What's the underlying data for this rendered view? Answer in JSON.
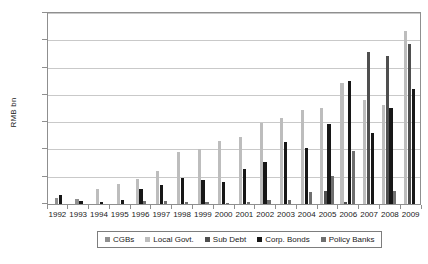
{
  "chart_data": {
    "type": "bar",
    "title": "",
    "xlabel": "",
    "ylabel": "RMB bn",
    "ylim": [
      0,
      1400
    ],
    "ytick_values": [
      0,
      200,
      400,
      600,
      800,
      1000,
      1200,
      1400
    ],
    "ytick_labels": [
      "0",
      "200",
      "400",
      "600",
      "800",
      "1,000",
      "1,200",
      "1,400"
    ],
    "grid": true,
    "legend_position": "bottom",
    "categories": [
      "1992",
      "1993",
      "1994",
      "1995",
      "1996",
      "1997",
      "1998",
      "1999",
      "2000",
      "2001",
      "2002",
      "2003",
      "2004",
      "2005",
      "2006",
      "2007",
      "2008",
      "2009"
    ],
    "series": [
      {
        "name": "CGBs",
        "color": "#8f8f8f",
        "values": [
          45,
          35,
          0,
          0,
          0,
          0,
          0,
          0,
          0,
          0,
          0,
          0,
          0,
          0,
          0,
          0,
          0,
          0
        ]
      },
      {
        "name": "Local Govt.",
        "color": "#bdbdbd",
        "values": [
          0,
          0,
          113,
          150,
          182,
          242,
          382,
          400,
          462,
          490,
          594,
          627,
          692,
          703,
          884,
          766,
          723,
          1270
        ]
      },
      {
        "name": "Sub Debt",
        "color": "#4f4f4f",
        "values": [
          0,
          0,
          0,
          0,
          0,
          0,
          0,
          0,
          0,
          0,
          0,
          0,
          0,
          97,
          16,
          1111,
          1083,
          1170
        ]
      },
      {
        "name": "Corp. Bonds",
        "color": "#171717",
        "values": [
          64,
          19,
          13,
          28,
          108,
          143,
          194,
          178,
          163,
          258,
          306,
          456,
          413,
          586,
          901,
          518,
          701,
          845
        ]
      },
      {
        "name": "Policy Banks",
        "color": "#6f6f6f",
        "values": [
          0,
          0,
          0,
          0,
          24,
          21,
          12,
          12,
          6,
          13,
          27,
          32,
          90,
          203,
          392,
          0,
          96,
          0
        ]
      }
    ]
  },
  "legend": {
    "items": [
      {
        "label": "CGBs",
        "color": "#8f8f8f"
      },
      {
        "label": "Local Govt.",
        "color": "#bdbdbd"
      },
      {
        "label": "Sub Debt",
        "color": "#4f4f4f"
      },
      {
        "label": "Corp. Bonds",
        "color": "#171717"
      },
      {
        "label": "Policy Banks",
        "color": "#6f6f6f"
      }
    ]
  }
}
